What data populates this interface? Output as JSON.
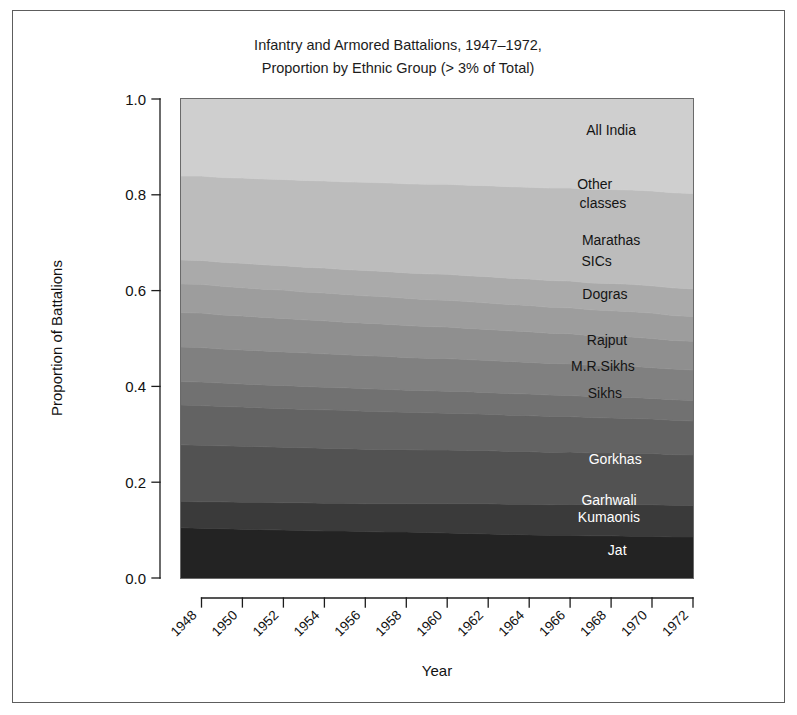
{
  "figure": {
    "title_line1": "Infantry and Armored Battalions, 1947–1972,",
    "title_line2": "Proportion by Ethnic Group (> 3% of Total)",
    "x_axis_title": "Year",
    "y_axis_title": "Proportion of Battalions",
    "frame_color": "#5d5d5d"
  },
  "chart_data": {
    "type": "area",
    "title": "Infantry and Armored Battalions, 1947–1972, Proportion by Ethnic Group (> 3% of Total)",
    "xlabel": "Year",
    "ylabel": "Proportion of Battalions",
    "stacked": true,
    "normalized": true,
    "grid": false,
    "legend_position": "inline-right",
    "xlim": [
      1947,
      1972
    ],
    "ylim": [
      0.0,
      1.0
    ],
    "x": [
      1947,
      1948,
      1949,
      1950,
      1951,
      1952,
      1953,
      1954,
      1955,
      1956,
      1957,
      1958,
      1959,
      1960,
      1961,
      1962,
      1963,
      1964,
      1965,
      1966,
      1967,
      1968,
      1969,
      1970,
      1971,
      1972
    ],
    "xticks": [
      1948,
      1950,
      1952,
      1954,
      1956,
      1958,
      1960,
      1962,
      1964,
      1966,
      1968,
      1970,
      1972
    ],
    "yticks": [
      0.0,
      0.2,
      0.4,
      0.6,
      0.8,
      1.0
    ],
    "ytick_labels": [
      "0.0",
      "0.2",
      "0.4",
      "0.6",
      "0.8",
      "1.0"
    ],
    "series": [
      {
        "name": "Jat",
        "color": "#232323",
        "label_color": "#ffffff",
        "values": [
          0.105,
          0.104,
          0.103,
          0.102,
          0.101,
          0.1,
          0.099,
          0.098,
          0.098,
          0.097,
          0.096,
          0.096,
          0.095,
          0.094,
          0.093,
          0.092,
          0.091,
          0.09,
          0.089,
          0.089,
          0.088,
          0.088,
          0.087,
          0.087,
          0.086,
          0.086
        ]
      },
      {
        "name": "Garhwali Kumaonis",
        "color": "#3a3a3a",
        "label_color": "#ffffff",
        "values": [
          0.055,
          0.055,
          0.056,
          0.056,
          0.057,
          0.057,
          0.058,
          0.058,
          0.058,
          0.058,
          0.059,
          0.059,
          0.06,
          0.061,
          0.062,
          0.063,
          0.063,
          0.064,
          0.064,
          0.065,
          0.065,
          0.065,
          0.066,
          0.066,
          0.066,
          0.066
        ]
      },
      {
        "name": "Gorkhas",
        "color": "#525252",
        "label_color": "#ffffff",
        "values": [
          0.118,
          0.118,
          0.117,
          0.117,
          0.116,
          0.116,
          0.115,
          0.115,
          0.114,
          0.114,
          0.113,
          0.113,
          0.112,
          0.112,
          0.111,
          0.111,
          0.11,
          0.11,
          0.109,
          0.109,
          0.108,
          0.108,
          0.107,
          0.107,
          0.106,
          0.106
        ]
      },
      {
        "name": "Sikhs",
        "color": "#636363",
        "label_color": "#141414",
        "values": [
          0.083,
          0.083,
          0.082,
          0.082,
          0.081,
          0.081,
          0.08,
          0.08,
          0.08,
          0.079,
          0.079,
          0.078,
          0.078,
          0.077,
          0.077,
          0.076,
          0.076,
          0.075,
          0.075,
          0.074,
          0.074,
          0.073,
          0.073,
          0.072,
          0.072,
          0.071
        ]
      },
      {
        "name": "M.R.Sikhs",
        "color": "#717171",
        "label_color": "#141414",
        "values": [
          0.049,
          0.049,
          0.049,
          0.048,
          0.048,
          0.048,
          0.048,
          0.047,
          0.047,
          0.047,
          0.047,
          0.046,
          0.046,
          0.046,
          0.046,
          0.045,
          0.045,
          0.045,
          0.045,
          0.044,
          0.044,
          0.044,
          0.044,
          0.043,
          0.043,
          0.043
        ]
      },
      {
        "name": "Rajput",
        "color": "#808080",
        "label_color": "#141414",
        "values": [
          0.072,
          0.072,
          0.071,
          0.071,
          0.071,
          0.07,
          0.07,
          0.07,
          0.069,
          0.069,
          0.069,
          0.068,
          0.068,
          0.068,
          0.067,
          0.067,
          0.067,
          0.066,
          0.066,
          0.066,
          0.065,
          0.065,
          0.065,
          0.064,
          0.064,
          0.064
        ]
      },
      {
        "name": "Dogras",
        "color": "#8f8f8f",
        "label_color": "#141414",
        "values": [
          0.072,
          0.072,
          0.071,
          0.071,
          0.07,
          0.07,
          0.069,
          0.069,
          0.068,
          0.068,
          0.067,
          0.067,
          0.066,
          0.066,
          0.065,
          0.065,
          0.064,
          0.064,
          0.063,
          0.063,
          0.062,
          0.062,
          0.061,
          0.061,
          0.06,
          0.06
        ]
      },
      {
        "name": "SICs",
        "color": "#9d9d9d",
        "label_color": "#141414",
        "values": [
          0.06,
          0.06,
          0.06,
          0.059,
          0.059,
          0.059,
          0.058,
          0.058,
          0.058,
          0.057,
          0.057,
          0.057,
          0.056,
          0.056,
          0.056,
          0.055,
          0.055,
          0.055,
          0.054,
          0.054,
          0.054,
          0.053,
          0.053,
          0.053,
          0.052,
          0.052
        ]
      },
      {
        "name": "Marathas",
        "color": "#aaaaaa",
        "label_color": "#141414",
        "values": [
          0.05,
          0.05,
          0.05,
          0.051,
          0.051,
          0.051,
          0.052,
          0.052,
          0.052,
          0.053,
          0.053,
          0.053,
          0.054,
          0.054,
          0.054,
          0.055,
          0.055,
          0.055,
          0.056,
          0.056,
          0.056,
          0.057,
          0.057,
          0.057,
          0.058,
          0.058
        ]
      },
      {
        "name": "Other classes",
        "color": "#bcbcbc",
        "label_color": "#141414",
        "values": [
          0.175,
          0.176,
          0.177,
          0.178,
          0.179,
          0.18,
          0.181,
          0.182,
          0.183,
          0.184,
          0.185,
          0.186,
          0.187,
          0.188,
          0.189,
          0.19,
          0.191,
          0.192,
          0.193,
          0.194,
          0.195,
          0.196,
          0.197,
          0.198,
          0.199,
          0.2
        ]
      },
      {
        "name": "All India",
        "color": "#cfcfcf",
        "label_color": "#141414",
        "values": [
          0.161,
          0.161,
          0.164,
          0.165,
          0.167,
          0.168,
          0.17,
          0.171,
          0.173,
          0.174,
          0.175,
          0.177,
          0.178,
          0.178,
          0.18,
          0.181,
          0.183,
          0.184,
          0.186,
          0.186,
          0.189,
          0.189,
          0.19,
          0.192,
          0.196,
          0.198
        ]
      }
    ],
    "inline_labels": [
      {
        "text": "All India",
        "series": "All India",
        "x": 1968.0,
        "y": 0.925
      },
      {
        "text": "Other",
        "series": "Other classes",
        "x": 1967.2,
        "y": 0.812
      },
      {
        "text": "classes",
        "series": "Other classes",
        "x": 1967.6,
        "y": 0.772
      },
      {
        "text": "Marathas",
        "series": "Marathas",
        "x": 1968.0,
        "y": 0.695
      },
      {
        "text": "SICs",
        "series": "SICs",
        "x": 1967.3,
        "y": 0.652
      },
      {
        "text": "Dogras",
        "series": "Dogras",
        "x": 1967.7,
        "y": 0.582
      },
      {
        "text": "Rajput",
        "series": "Rajput",
        "x": 1967.8,
        "y": 0.487
      },
      {
        "text": "M.R.Sikhs",
        "series": "M.R.Sikhs",
        "x": 1967.6,
        "y": 0.432
      },
      {
        "text": "Sikhs",
        "series": "Sikhs",
        "x": 1967.7,
        "y": 0.375
      },
      {
        "text": "Gorkhas",
        "series": "Gorkhas",
        "x": 1968.2,
        "y": 0.238
      },
      {
        "text": "Garhwali",
        "series": "Garhwali Kumaonis",
        "x": 1967.9,
        "y": 0.152
      },
      {
        "text": "Kumaonis",
        "series": "Garhwali Kumaonis",
        "x": 1967.9,
        "y": 0.118
      },
      {
        "text": "Jat",
        "series": "Jat",
        "x": 1968.3,
        "y": 0.048
      }
    ]
  }
}
